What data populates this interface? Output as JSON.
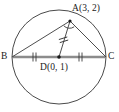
{
  "figure": {
    "background_color": "#ffffff",
    "stroke_color": "#3a3a3a",
    "diameter_color": "#8c8c8c",
    "label_color": "#1a1a1a"
  },
  "labels": {
    "a": "A(3, 2)",
    "b": "B",
    "c": "C",
    "d": "D(0, 1)"
  },
  "points": {
    "a": {
      "name": "A",
      "coords": "(3, 2)",
      "x": 70,
      "y": 21
    },
    "b": {
      "name": "B",
      "coords": "",
      "x": 12,
      "y": 57
    },
    "c": {
      "name": "C",
      "coords": "",
      "x": 106,
      "y": 57
    },
    "d": {
      "name": "D",
      "coords": "(0, 1)",
      "x": 59,
      "y": 57
    }
  },
  "circle": {
    "center_x": 59,
    "center_y": 57,
    "radius": 47
  },
  "segments": [
    {
      "name": "segment-ab",
      "from": "A",
      "to": "B",
      "style": "thin"
    },
    {
      "name": "segment-ad",
      "from": "A",
      "to": "D",
      "style": "thin",
      "ticks": 2
    },
    {
      "name": "segment-ac",
      "from": "A",
      "to": "C",
      "style": "thin"
    },
    {
      "name": "segment-bc",
      "from": "B",
      "to": "C",
      "style": "diameter"
    },
    {
      "name": "segment-bd",
      "from": "B",
      "to": "D",
      "style": "diameter",
      "ticks": 2
    },
    {
      "name": "segment-dc",
      "from": "D",
      "to": "C",
      "style": "diameter",
      "ticks": 2
    }
  ],
  "markers": {
    "angle_arc_at": "A",
    "tick_count": 2,
    "dots": [
      "A",
      "D"
    ]
  }
}
